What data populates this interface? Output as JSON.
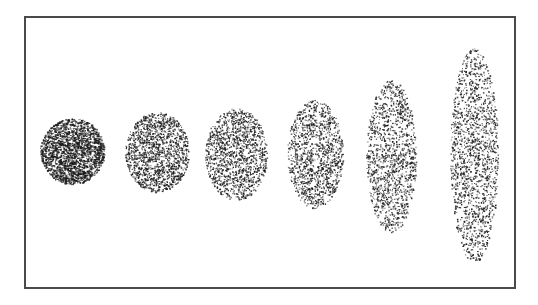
{
  "figure": {
    "frame": {
      "x": 24,
      "y": 16,
      "width": 492,
      "height": 273,
      "stroke": "#4a4a4a"
    },
    "dot_color": "#1a1a1a",
    "shapes": [
      {
        "id": "circle-1",
        "cx": 72,
        "cy": 151,
        "rx": 32,
        "ry": 33,
        "density": 0.55
      },
      {
        "id": "ellipse-2",
        "cx": 157,
        "cy": 152,
        "rx": 32,
        "ry": 40,
        "density": 0.38
      },
      {
        "id": "ellipse-3",
        "cx": 236,
        "cy": 154,
        "rx": 31,
        "ry": 46,
        "density": 0.3
      },
      {
        "id": "ellipse-4",
        "cx": 315,
        "cy": 154,
        "rx": 28,
        "ry": 54,
        "density": 0.26
      },
      {
        "id": "ellipse-5",
        "cx": 391,
        "cy": 156,
        "rx": 25,
        "ry": 76,
        "density": 0.22
      },
      {
        "id": "ellipse-6",
        "cx": 474,
        "cy": 155,
        "rx": 24,
        "ry": 107,
        "density": 0.2
      }
    ]
  }
}
